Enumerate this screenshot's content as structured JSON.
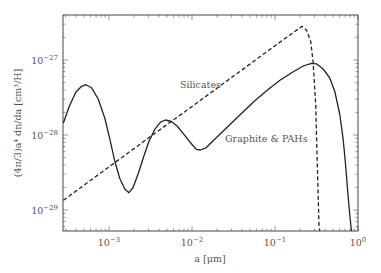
{
  "chart_data": {
    "type": "line",
    "title": "",
    "xlabel": "a [μm]",
    "ylabel": "(4π/3)a⁴ dn/da [cm³/H]",
    "xscale": "log",
    "yscale": "log",
    "xlim": [
      0.00028,
      1.0
    ],
    "ylim": [
      5e-30,
      4e-27
    ],
    "grid": false,
    "legend": "inline annotations",
    "x_ticks": [
      {
        "value": 0.001,
        "label_base": "10",
        "label_exp": "−3"
      },
      {
        "value": 0.01,
        "label_base": "10",
        "label_exp": "−2"
      },
      {
        "value": 0.1,
        "label_base": "10",
        "label_exp": "−1"
      },
      {
        "value": 1.0,
        "label_base": "10",
        "label_exp": "0"
      }
    ],
    "y_ticks": [
      {
        "value": 1e-27,
        "label_base": "10",
        "label_exp": "−27"
      },
      {
        "value": 1e-28,
        "label_base": "10",
        "label_exp": "−28"
      },
      {
        "value": 1e-29,
        "label_base": "10",
        "label_exp": "−29"
      }
    ],
    "series": [
      {
        "name": "Silicates",
        "style": "dashed",
        "color": "#222222",
        "label_pos": {
          "x": 180,
          "y": 88
        },
        "points_log": [
          [
            -3.55,
            -28.87
          ],
          [
            -3.0,
            -28.425
          ],
          [
            -2.5,
            -28.02
          ],
          [
            -2.0,
            -27.62
          ],
          [
            -1.5,
            -27.215
          ],
          [
            -1.0,
            -26.81
          ],
          [
            -0.675,
            -26.55
          ],
          [
            -0.62,
            -26.6
          ],
          [
            -0.57,
            -26.75
          ],
          [
            -0.54,
            -27.04
          ],
          [
            -0.51,
            -27.6
          ],
          [
            -0.49,
            -28.4
          ],
          [
            -0.47,
            -29.2
          ],
          [
            -0.46,
            -29.31
          ]
        ]
      },
      {
        "name": "Graphite & PAHs",
        "style": "solid",
        "color": "#222222",
        "label_pos": {
          "x": 225,
          "y": 142
        },
        "points_log": [
          [
            -3.55,
            -27.84
          ],
          [
            -3.48,
            -27.62
          ],
          [
            -3.4,
            -27.43
          ],
          [
            -3.33,
            -27.35
          ],
          [
            -3.28,
            -27.33
          ],
          [
            -3.21,
            -27.37
          ],
          [
            -3.13,
            -27.52
          ],
          [
            -3.05,
            -27.78
          ],
          [
            -2.99,
            -28.05
          ],
          [
            -2.93,
            -28.35
          ],
          [
            -2.87,
            -28.58
          ],
          [
            -2.81,
            -28.72
          ],
          [
            -2.76,
            -28.77
          ],
          [
            -2.71,
            -28.7
          ],
          [
            -2.65,
            -28.52
          ],
          [
            -2.58,
            -28.28
          ],
          [
            -2.52,
            -28.09
          ],
          [
            -2.45,
            -27.93
          ],
          [
            -2.38,
            -27.83
          ],
          [
            -2.32,
            -27.8
          ],
          [
            -2.25,
            -27.82
          ],
          [
            -2.18,
            -27.88
          ],
          [
            -2.1,
            -27.99
          ],
          [
            -2.02,
            -28.1
          ],
          [
            -1.95,
            -28.19
          ],
          [
            -1.9,
            -28.2
          ],
          [
            -1.83,
            -28.17
          ],
          [
            -1.72,
            -28.05
          ],
          [
            -1.58,
            -27.9
          ],
          [
            -1.42,
            -27.73
          ],
          [
            -1.25,
            -27.55
          ],
          [
            -1.08,
            -27.39
          ],
          [
            -0.94,
            -27.27
          ],
          [
            -0.8,
            -27.17
          ],
          [
            -0.66,
            -27.08
          ],
          [
            -0.56,
            -27.045
          ],
          [
            -0.5,
            -27.05
          ],
          [
            -0.42,
            -27.12
          ],
          [
            -0.34,
            -27.24
          ],
          [
            -0.28,
            -27.42
          ],
          [
            -0.22,
            -27.72
          ],
          [
            -0.18,
            -28.05
          ],
          [
            -0.15,
            -28.4
          ],
          [
            -0.12,
            -28.8
          ],
          [
            -0.1,
            -29.05
          ],
          [
            -0.08,
            -29.31
          ]
        ]
      }
    ]
  },
  "layout": {
    "plot_left": 63,
    "plot_right": 358,
    "plot_top": 15,
    "plot_bottom": 231,
    "x_px_at_log_minus3": 109,
    "x_px_per_decade": 83,
    "y_px_at_log_minus27": 60,
    "y_px_per_decade": 75
  }
}
